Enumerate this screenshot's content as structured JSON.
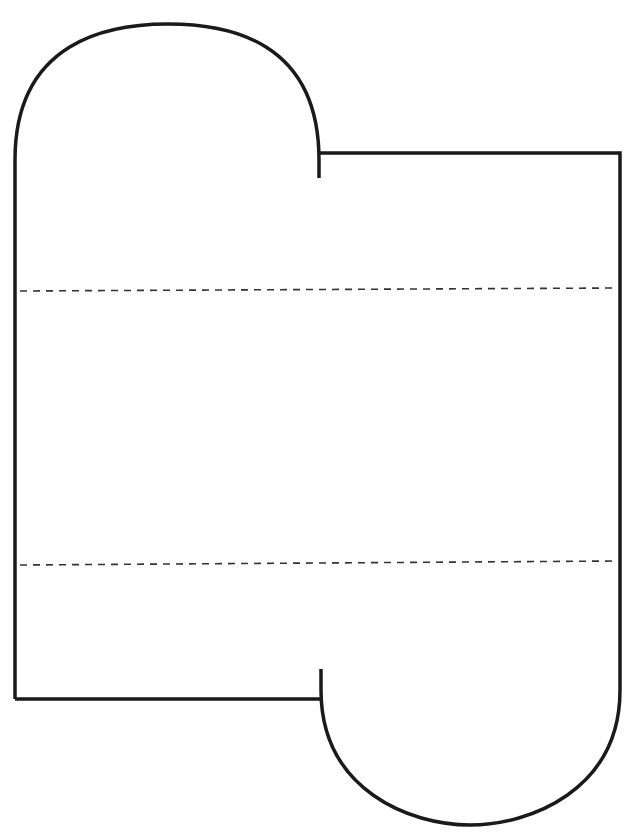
{
  "diagram": {
    "type": "paper-cutout-template",
    "colors": {
      "background": "#ffffff",
      "outline": "#1a1a1a",
      "fold_line": "#333333"
    },
    "outline": {
      "stroke_width": 3.5
    },
    "fold_lines": [
      {
        "name": "upper-fold",
        "y_left": 291,
        "y_right": 288
      },
      {
        "name": "lower-fold",
        "y_left": 565,
        "y_right": 561
      }
    ]
  }
}
